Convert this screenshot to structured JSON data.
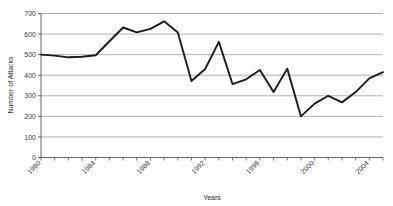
{
  "chart_data": {
    "type": "line",
    "title": "",
    "xlabel": "Years",
    "ylabel": "Number of Attacks",
    "ylim": [
      0,
      700
    ],
    "xlim": [
      1980,
      2005
    ],
    "ytick_step": 100,
    "yticks": [
      0,
      100,
      200,
      300,
      400,
      500,
      600,
      700
    ],
    "xticks": [
      1980,
      1984,
      1988,
      1992,
      1996,
      2000,
      2004
    ],
    "xtick_labels": [
      "1980",
      "1984",
      "1988",
      "1992",
      "1996",
      "2000",
      "2004"
    ],
    "xtick_label_rotation": -45,
    "grid": "horizontal",
    "legend": "none",
    "line_color": "#1a1a1a",
    "gridline_color": "#9a9a9a",
    "axis_color": "#555555",
    "background_color": "#ffffff",
    "x": [
      1980,
      1981,
      1982,
      1983,
      1984,
      1985,
      1986,
      1987,
      1988,
      1989,
      1990,
      1991,
      1992,
      1993,
      1994,
      1995,
      1996,
      1997,
      1998,
      1999,
      2000,
      2001,
      2002,
      2003,
      2004,
      2005
    ],
    "values": [
      500,
      495,
      487,
      490,
      497,
      565,
      632,
      608,
      625,
      662,
      608,
      372,
      430,
      562,
      357,
      380,
      425,
      318,
      432,
      200,
      262,
      300,
      268,
      318,
      385,
      415
    ],
    "series": [
      {
        "name": "Number of Attacks",
        "values": [
          500,
          495,
          487,
          490,
          497,
          565,
          632,
          608,
          625,
          662,
          608,
          372,
          430,
          562,
          357,
          380,
          425,
          318,
          432,
          200,
          262,
          300,
          268,
          318,
          385,
          415
        ]
      }
    ],
    "points": [
      {
        "x": 1980,
        "y": 500
      },
      {
        "x": 1981,
        "y": 495
      },
      {
        "x": 1982,
        "y": 487
      },
      {
        "x": 1983,
        "y": 490
      },
      {
        "x": 1984,
        "y": 497
      },
      {
        "x": 1985,
        "y": 565
      },
      {
        "x": 1986,
        "y": 632
      },
      {
        "x": 1987,
        "y": 608
      },
      {
        "x": 1988,
        "y": 625
      },
      {
        "x": 1989,
        "y": 662
      },
      {
        "x": 1990,
        "y": 608
      },
      {
        "x": 1991,
        "y": 372
      },
      {
        "x": 1992,
        "y": 430
      },
      {
        "x": 1993,
        "y": 562
      },
      {
        "x": 1994,
        "y": 357
      },
      {
        "x": 1995,
        "y": 380
      },
      {
        "x": 1996,
        "y": 425
      },
      {
        "x": 1997,
        "y": 318
      },
      {
        "x": 1998,
        "y": 432
      },
      {
        "x": 1999,
        "y": 200
      },
      {
        "x": 2000,
        "y": 262
      },
      {
        "x": 2001,
        "y": 300
      },
      {
        "x": 2002,
        "y": 268
      },
      {
        "x": 2003,
        "y": 318
      },
      {
        "x": 2004,
        "y": 385
      },
      {
        "x": 2005,
        "y": 415
      }
    ]
  }
}
